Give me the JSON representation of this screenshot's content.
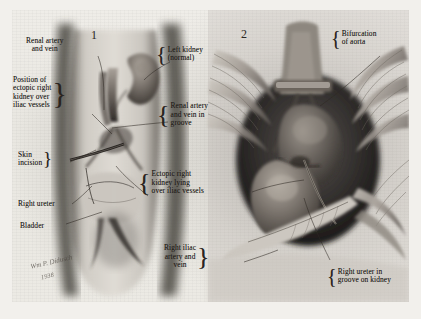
{
  "plate": {
    "medium": "pencil-and-wash anatomical illustration",
    "background_color": "#eceae4",
    "border_color": "#ffffff",
    "ink_color": "#241f1b"
  },
  "panels": [
    {
      "number": "1",
      "name": "panel-one-surgical-exposure"
    },
    {
      "number": "2",
      "name": "panel-two-close-up"
    }
  ],
  "labels": [
    {
      "id": "renal-artery-and-vein",
      "text": "Renal artery\nand vein",
      "brace": "none",
      "panel": "1"
    },
    {
      "id": "position-of-ectopic-right-kidney",
      "text": "Position of\nectopic right\nkidney over\niliac vessels",
      "brace": "right",
      "panel": "1"
    },
    {
      "id": "skin-incision",
      "text": "Skin\nincision",
      "brace": "right",
      "panel": "1"
    },
    {
      "id": "right-ureter",
      "text": "Right ureter",
      "brace": "none",
      "panel": "1"
    },
    {
      "id": "bladder",
      "text": "Bladder",
      "brace": "none",
      "panel": "1"
    },
    {
      "id": "left-kidney-normal",
      "text": "Left kidney\n(normal)",
      "brace": "left",
      "panel": "1"
    },
    {
      "id": "renal-artery-and-vein-in-groove",
      "text": "Renal artery\nand vein in\ngroove",
      "brace": "left",
      "panel": "1"
    },
    {
      "id": "ectopic-right-kidney-lying",
      "text": "Ectopic right\nkidney lying\nover iliac vessels",
      "brace": "left",
      "panel": "1"
    },
    {
      "id": "right-iliac-artery-and-vein",
      "text": "Right iliac\nartery and\nvein",
      "brace": "right",
      "panel": "2"
    },
    {
      "id": "bifurcation-of-aorta",
      "text": "Bifurcation\nof aorta",
      "brace": "left",
      "panel": "2"
    },
    {
      "id": "right-ureter-in-groove-on-kidney",
      "text": "Right ureter in\ngroove on kidney",
      "brace": "left",
      "panel": "2"
    }
  ],
  "signature": {
    "artist": "Wm P. Didusch",
    "year": "1938"
  }
}
